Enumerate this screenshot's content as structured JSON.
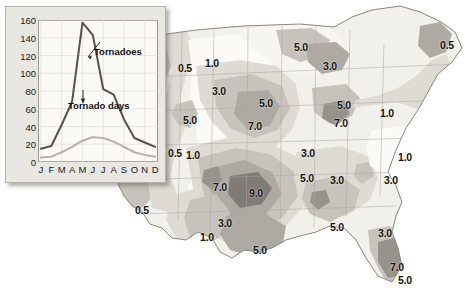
{
  "figure": {
    "kind": "tornado-climatology-map-with-inset-chart"
  },
  "map": {
    "title": "",
    "contour_labels": [
      {
        "value": "0.5",
        "x": 178,
        "y": 63
      },
      {
        "value": "1.0",
        "x": 205,
        "y": 58
      },
      {
        "value": "5.0",
        "x": 294,
        "y": 42
      },
      {
        "value": "3.0",
        "x": 323,
        "y": 61
      },
      {
        "value": "5.0",
        "x": 337,
        "y": 100
      },
      {
        "value": "7.0",
        "x": 334,
        "y": 118
      },
      {
        "value": "0.5",
        "x": 440,
        "y": 40
      },
      {
        "value": "1.0",
        "x": 380,
        "y": 108
      },
      {
        "value": "3.0",
        "x": 212,
        "y": 86
      },
      {
        "value": "5.0",
        "x": 259,
        "y": 98
      },
      {
        "value": "7.0",
        "x": 248,
        "y": 121
      },
      {
        "value": "5.0",
        "x": 183,
        "y": 115
      },
      {
        "value": "0.5",
        "x": 168,
        "y": 148
      },
      {
        "value": "1.0",
        "x": 186,
        "y": 150
      },
      {
        "value": "7.0",
        "x": 213,
        "y": 182
      },
      {
        "value": "9.0",
        "x": 249,
        "y": 188
      },
      {
        "value": "5.0",
        "x": 300,
        "y": 173
      },
      {
        "value": "3.0",
        "x": 301,
        "y": 148
      },
      {
        "value": "1.0",
        "x": 398,
        "y": 152
      },
      {
        "value": "3.0",
        "x": 384,
        "y": 175
      },
      {
        "value": "3.0",
        "x": 330,
        "y": 175
      },
      {
        "value": "0.5",
        "x": 135,
        "y": 205
      },
      {
        "value": "3.0",
        "x": 218,
        "y": 218
      },
      {
        "value": "1.0",
        "x": 200,
        "y": 232
      },
      {
        "value": "5.0",
        "x": 253,
        "y": 245
      },
      {
        "value": "5.0",
        "x": 330,
        "y": 222
      },
      {
        "value": "3.0",
        "x": 378,
        "y": 228
      },
      {
        "value": "7.0",
        "x": 390,
        "y": 262
      },
      {
        "value": "5.0",
        "x": 398,
        "y": 275
      }
    ],
    "colors": {
      "shade_0": "#ffffff",
      "shade_1": "#f2f0ec",
      "shade_2": "#dedbd5",
      "shade_3": "#c7c3bc",
      "shade_4": "#aeaaa3",
      "shade_5": "#97938c",
      "shade_6": "#807c76",
      "outline": "#8a8780"
    }
  },
  "chart_data": {
    "type": "line",
    "title": "",
    "xlabel": "",
    "ylabel": "",
    "categories": [
      "J",
      "F",
      "M",
      "A",
      "M",
      "J",
      "J",
      "A",
      "S",
      "O",
      "N",
      "D"
    ],
    "x_tick_labels": [
      "J",
      "F",
      "M",
      "A",
      "M",
      "J",
      "J",
      "A",
      "S",
      "O",
      "N",
      "D"
    ],
    "y_tick_labels": [
      "0",
      "20",
      "40",
      "60",
      "80",
      "100",
      "120",
      "140",
      "160"
    ],
    "y_ticks": [
      0,
      20,
      40,
      60,
      80,
      100,
      120,
      140,
      160
    ],
    "ylim": [
      0,
      160
    ],
    "grid": true,
    "legend": "inline-annotations",
    "series": [
      {
        "name": "Tornadoes",
        "color": "#55524c",
        "values": [
          15,
          18,
          42,
          68,
          157,
          143,
          82,
          76,
          48,
          27,
          22,
          17
        ]
      },
      {
        "name": "Tornado days",
        "color": "#b6b2aa",
        "values": [
          5,
          6,
          11,
          17,
          24,
          28,
          27,
          23,
          17,
          11,
          8,
          6
        ]
      }
    ],
    "annotations": [
      {
        "text": "Tornadoes",
        "series": "Tornadoes"
      },
      {
        "text": "Tornado days",
        "series": "Tornado days"
      }
    ]
  }
}
